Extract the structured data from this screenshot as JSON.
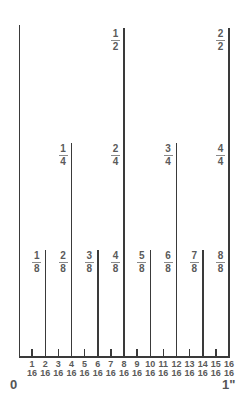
{
  "diagram": {
    "title": "",
    "scale": {
      "origin_x": 19,
      "inch_px": 210,
      "baseline_y": 357
    },
    "colors": {
      "line": "#3a3a3a",
      "label": "#5a5a5a"
    },
    "end_labels": {
      "start": "0",
      "end": "1\""
    },
    "halves": [
      {
        "num": "1",
        "den": "2",
        "pos16": 8
      },
      {
        "num": "2",
        "den": "2",
        "pos16": 16
      }
    ],
    "quarters": [
      {
        "num": "1",
        "den": "4",
        "pos16": 4
      },
      {
        "num": "2",
        "den": "4",
        "pos16": 8
      },
      {
        "num": "3",
        "den": "4",
        "pos16": 12
      },
      {
        "num": "4",
        "den": "4",
        "pos16": 16
      }
    ],
    "eighths": [
      {
        "num": "1",
        "den": "8",
        "pos16": 2
      },
      {
        "num": "2",
        "den": "8",
        "pos16": 4
      },
      {
        "num": "3",
        "den": "8",
        "pos16": 6
      },
      {
        "num": "4",
        "den": "8",
        "pos16": 8
      },
      {
        "num": "5",
        "den": "8",
        "pos16": 10
      },
      {
        "num": "6",
        "den": "8",
        "pos16": 12
      },
      {
        "num": "7",
        "den": "8",
        "pos16": 14
      },
      {
        "num": "8",
        "den": "8",
        "pos16": 16
      }
    ],
    "sixteenths": [
      {
        "num": "1",
        "den": "16"
      },
      {
        "num": "2",
        "den": "16"
      },
      {
        "num": "3",
        "den": "16"
      },
      {
        "num": "4",
        "den": "16"
      },
      {
        "num": "5",
        "den": "16"
      },
      {
        "num": "6",
        "den": "16"
      },
      {
        "num": "7",
        "den": "16"
      },
      {
        "num": "8",
        "den": "16"
      },
      {
        "num": "9",
        "den": "16"
      },
      {
        "num": "10",
        "den": "16"
      },
      {
        "num": "11",
        "den": "16"
      },
      {
        "num": "12",
        "den": "16"
      },
      {
        "num": "13",
        "den": "16"
      },
      {
        "num": "14",
        "den": "16"
      },
      {
        "num": "15",
        "den": "16"
      },
      {
        "num": "16",
        "den": "16"
      }
    ],
    "tick_tops": {
      "zero": 25,
      "half": 28,
      "quarter": 143,
      "eighth": 250,
      "sixteenth": 349
    }
  }
}
